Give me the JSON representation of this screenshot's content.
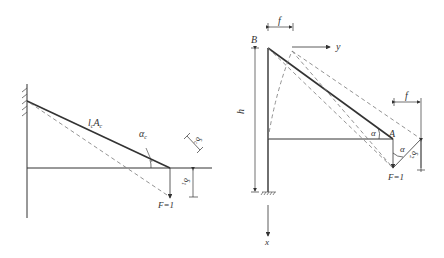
{
  "left_figure": {
    "bar_label": "l",
    "bar_label_sub": "c",
    "area_label": "A",
    "area_label_sub": "c",
    "angle_label": "α",
    "angle_label_sub": "c",
    "elongation_label": "δ",
    "elongation_label_sub": "c",
    "deflection_label": "δ",
    "deflection_label_sub": "1",
    "load_label": "F=1"
  },
  "right_figure": {
    "top_node_label": "B",
    "tip_node_label": "A",
    "height_label": "h",
    "top_shift_label": "f",
    "tip_shift_label": "f",
    "y_axis_label": "y",
    "x_axis_label": "x",
    "angle_label_upper": "α",
    "angle_label_lower": "α",
    "deflection_label": "δ",
    "deflection_label_sub": "2",
    "load_label": "F=1"
  },
  "colors": {
    "line": "#333333",
    "dashed": "#777777"
  }
}
